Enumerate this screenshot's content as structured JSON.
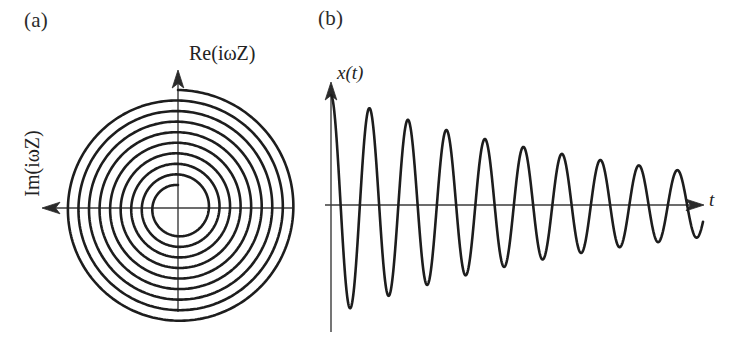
{
  "figure": {
    "width": 738,
    "height": 339,
    "background": "#ffffff",
    "ink_color": "#1d1d1d",
    "axis_color": "#3b3b3b"
  },
  "panels": {
    "a": {
      "label": "(a)",
      "caption_position": "top-left",
      "axis_vertical_label": "Re(iωZ)",
      "axis_horizontal_label": "Im(iωZ)",
      "vertical_axis_direction": "up",
      "horizontal_axis_direction": "left",
      "origin_px": {
        "x": 178,
        "y": 208
      },
      "description": "Outward Archimedean spiral (Nyquist plot of iωZ for a damped resonator)"
    },
    "b": {
      "label": "(b)",
      "caption_position": "top-left",
      "axis_vertical_label": "x(t)",
      "axis_horizontal_label": "t",
      "vertical_axis_direction": "up",
      "horizontal_axis_direction": "right",
      "origin_px": {
        "x": 331,
        "y": 205
      },
      "description": "Exponentially damped sinusoidal oscillation x(t)"
    }
  },
  "chart_data": [
    {
      "type": "line",
      "name": "nyquist-spiral",
      "title": "(a)",
      "xlabel": "Im(iωZ)",
      "ylabel": "Re(iωZ)",
      "curve_family": "archimedean-spiral",
      "turns": 9,
      "r_start": 23,
      "r_end": 118,
      "theta_start_deg": 90,
      "theta_end_deg": 3330,
      "direction": "counterclockwise-outward",
      "grid": false,
      "legend": false,
      "axis_arrows": {
        "vertical": "up",
        "horizontal": "left"
      },
      "axis_extent_px": {
        "x_left": 44,
        "x_right": 292,
        "y_top": 72,
        "y_bottom": 312
      }
    },
    {
      "type": "line",
      "name": "damped-oscillation",
      "title": "(b)",
      "xlabel": "t",
      "ylabel": "x(t)",
      "curve_family": "damped-sinusoid",
      "equation": "x(t) = A exp(-t/tau) cos(omega t)",
      "amplitude_initial": 110,
      "amplitude_final": 32,
      "decay_ratio_per_cycle": 0.88,
      "period_px": 38.5,
      "cycles_visible": 9.6,
      "grid": false,
      "legend": false,
      "axis_arrows": {
        "vertical": "up",
        "horizontal": "right"
      },
      "axis_extent_px": {
        "x_left": 331,
        "x_right": 703,
        "y_top": 82,
        "y_bottom": 332
      },
      "peaks_px": [
        {
          "x": 331,
          "y": 96
        },
        {
          "x": 366,
          "y": 100
        },
        {
          "x": 404,
          "y": 109
        },
        {
          "x": 443,
          "y": 118
        },
        {
          "x": 481,
          "y": 126
        },
        {
          "x": 519,
          "y": 133
        },
        {
          "x": 557,
          "y": 140
        },
        {
          "x": 595,
          "y": 146
        },
        {
          "x": 633,
          "y": 151
        },
        {
          "x": 671,
          "y": 156
        }
      ],
      "troughs_px": [
        {
          "x": 348,
          "y": 316
        },
        {
          "x": 386,
          "y": 302
        },
        {
          "x": 424,
          "y": 290
        },
        {
          "x": 462,
          "y": 280
        },
        {
          "x": 500,
          "y": 272
        },
        {
          "x": 538,
          "y": 265
        },
        {
          "x": 576,
          "y": 259
        },
        {
          "x": 614,
          "y": 254
        },
        {
          "x": 652,
          "y": 250
        },
        {
          "x": 690,
          "y": 247
        }
      ]
    }
  ]
}
